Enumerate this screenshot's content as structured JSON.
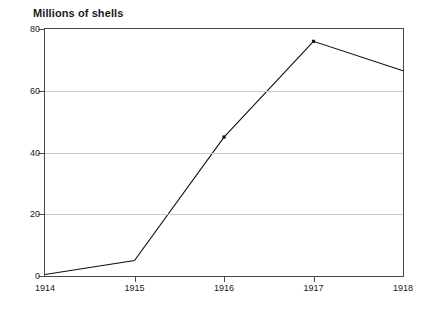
{
  "chart_data": {
    "type": "line",
    "title": "Millions of shells",
    "xlabel": "",
    "ylabel": "",
    "categories": [
      "1914",
      "1915",
      "1916",
      "1917",
      "1918"
    ],
    "values": [
      0.5,
      5,
      45,
      76,
      66.5
    ],
    "series": [
      {
        "name": "Millions of shells",
        "values": [
          0.5,
          5,
          45,
          76,
          66.5
        ]
      }
    ],
    "ylim": [
      0,
      80
    ],
    "yticks": [
      0,
      20,
      40,
      60,
      80
    ],
    "ytick_labels": [
      "0",
      "20",
      "40",
      "60",
      "80"
    ],
    "xtick_labels": [
      "1914",
      "1915",
      "1916",
      "1917",
      "1918"
    ],
    "grid": "horizontal",
    "legend": "none",
    "line_color": "#111111",
    "grid_color": "#c9c9c9",
    "frame_color": "#4a4a4a",
    "background": "#ffffff",
    "markers": [
      {
        "category": "1916",
        "value": 45
      },
      {
        "category": "1917",
        "value": 76
      }
    ]
  }
}
